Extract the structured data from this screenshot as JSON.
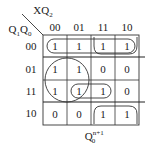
{
  "kmap": {
    "var_top": "XQ",
    "var_top_sub": "2",
    "var_left_a": "Q",
    "var_left_a_sub": "1",
    "var_left_b": "Q",
    "var_left_b_sub": "0",
    "col_headers": [
      "00",
      "01",
      "11",
      "10"
    ],
    "row_headers": [
      "00",
      "01",
      "11",
      "10"
    ],
    "cells": [
      [
        "1",
        "1",
        "1",
        "1"
      ],
      [
        "1",
        "1",
        "0",
        "0"
      ],
      [
        "1",
        "1",
        "1",
        "0"
      ],
      [
        "0",
        "0",
        "1",
        "1"
      ]
    ],
    "caption": "Q",
    "caption_sup": "n+1",
    "caption_sub": "0"
  }
}
